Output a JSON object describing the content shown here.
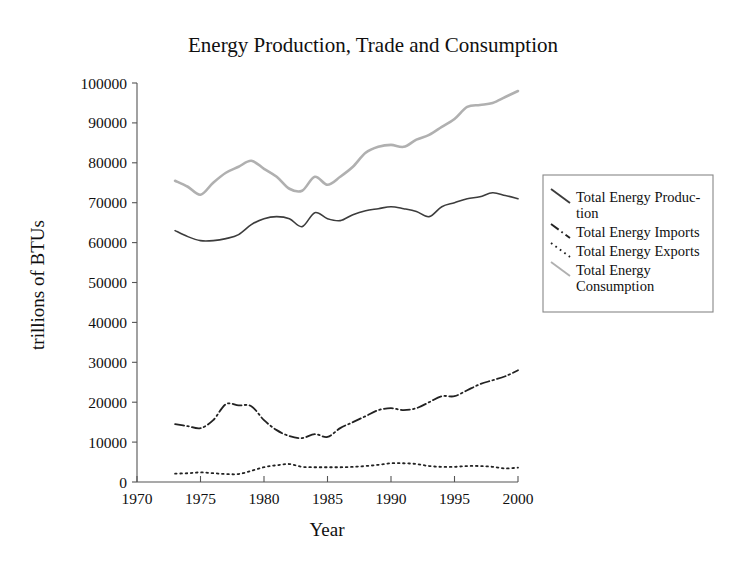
{
  "chart_data": {
    "type": "line",
    "title": "Energy Production, Trade and Consumption",
    "xlabel": "Year",
    "ylabel": "trillions of BTUs",
    "xlim": [
      1970,
      2000
    ],
    "ylim": [
      0,
      100000
    ],
    "xticks": [
      1970,
      1975,
      1980,
      1985,
      1990,
      1995,
      2000
    ],
    "xtick_labels": [
      "1970",
      "1975",
      "1980",
      "1985",
      "1990",
      "1995",
      "2000"
    ],
    "yticks": [
      0,
      10000,
      20000,
      30000,
      40000,
      50000,
      60000,
      70000,
      80000,
      90000,
      100000
    ],
    "ytick_labels": [
      "0",
      "10000",
      "20000",
      "30000",
      "40000",
      "50000",
      "60000",
      "70000",
      "80000",
      "90000",
      "100000"
    ],
    "grid": false,
    "legend_position": "right",
    "x": [
      1973,
      1974,
      1975,
      1976,
      1977,
      1978,
      1979,
      1980,
      1981,
      1982,
      1983,
      1984,
      1985,
      1986,
      1987,
      1988,
      1989,
      1990,
      1991,
      1992,
      1993,
      1994,
      1995,
      1996,
      1997,
      1998,
      1999,
      2000
    ],
    "series": [
      {
        "name": "Total Energy Production",
        "style": "solid",
        "color": "#3c3c3c",
        "width": 1.6,
        "values": [
          63000,
          61500,
          60500,
          60500,
          61000,
          62000,
          64500,
          66000,
          66500,
          66000,
          64000,
          67500,
          66000,
          65500,
          67000,
          68000,
          68500,
          69000,
          68500,
          67800,
          66500,
          69000,
          70000,
          71000,
          71500,
          72500,
          71800,
          71000
        ]
      },
      {
        "name": "Total Energy Imports",
        "style": "dashdot",
        "color": "#222222",
        "width": 1.8,
        "values": [
          14500,
          14000,
          13500,
          15500,
          19500,
          19200,
          19000,
          15500,
          13000,
          11500,
          11000,
          12000,
          11300,
          13500,
          15000,
          16500,
          18000,
          18500,
          18000,
          18500,
          20000,
          21500,
          21500,
          23000,
          24500,
          25500,
          26500,
          28000
        ]
      },
      {
        "name": "Total Energy Exports",
        "style": "dotted",
        "color": "#222222",
        "width": 1.8,
        "values": [
          2100,
          2200,
          2400,
          2200,
          2000,
          2000,
          2800,
          3700,
          4200,
          4500,
          3800,
          3700,
          3700,
          3700,
          3800,
          4000,
          4300,
          4700,
          4700,
          4500,
          4000,
          3800,
          3800,
          4000,
          4000,
          3800,
          3400,
          3600
        ]
      },
      {
        "name": "Total Energy Consumption",
        "style": "solid",
        "color": "#b0b0b0",
        "width": 2.6,
        "values": [
          75500,
          74000,
          72000,
          75000,
          77500,
          79000,
          80500,
          78500,
          76500,
          73500,
          73000,
          76500,
          74500,
          76500,
          79000,
          82500,
          84000,
          84500,
          84000,
          85800,
          87000,
          89000,
          91000,
          94000,
          94500,
          95000,
          96500,
          98000
        ]
      }
    ],
    "legend_entries": [
      {
        "label": "Total Energy Produc-\ntion",
        "style": "solid",
        "color": "#3c3c3c"
      },
      {
        "label": "Total Energy Imports",
        "style": "dashdot",
        "color": "#222222"
      },
      {
        "label": "Total Energy Exports",
        "style": "dotted",
        "color": "#222222"
      },
      {
        "label": "Total Energy\nConsumption",
        "style": "solid",
        "color": "#b0b0b0"
      }
    ]
  }
}
